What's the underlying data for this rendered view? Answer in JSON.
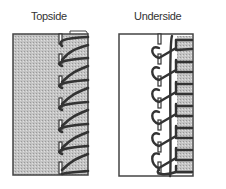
{
  "diagram": {
    "panels": [
      {
        "label": "Topside",
        "fabric_shade": "stippled gray"
      },
      {
        "label": "Underside",
        "fabric_shade": "white with gray edge strip"
      }
    ]
  },
  "colors": {
    "thread": "#3a3a3a",
    "fabric_gray": "#bdbdbd",
    "outline": "#444444",
    "background": "#ffffff"
  }
}
